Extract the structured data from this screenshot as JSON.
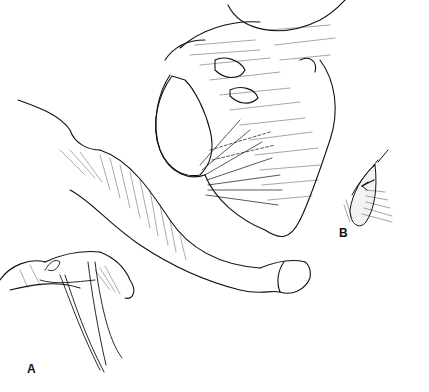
{
  "figure": {
    "type": "anatomical line illustration",
    "style": "black ink hatching on white",
    "colors": {
      "ink": "#111111",
      "background": "#ffffff"
    },
    "panels": [
      {
        "id": "A",
        "label": "A",
        "description": "Main view with suture/instrument strands lower left"
      },
      {
        "id": "B",
        "label": "B",
        "description": "Inset detail of oval structure with arrow"
      }
    ]
  }
}
